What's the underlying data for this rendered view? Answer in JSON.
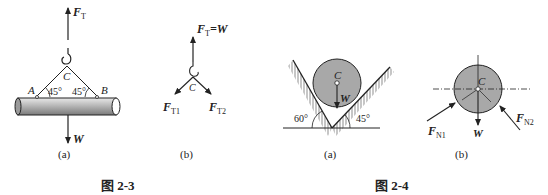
{
  "figure_2_3": {
    "caption": "图 2-3",
    "a": {
      "sublabel": "(a)",
      "force_top": "F",
      "force_top_sub": "T",
      "point_c": "C",
      "point_a": "A",
      "point_b": "B",
      "angle_left": "45°",
      "angle_right": "45°",
      "weight": "W"
    },
    "b": {
      "sublabel": "(b)",
      "force_top": "F",
      "force_top_sub": "T",
      "force_top_eq": "=W",
      "point_c": "C",
      "force_left": "F",
      "force_left_sub": "T1",
      "force_right": "F",
      "force_right_sub": "T2"
    }
  },
  "figure_2_4": {
    "caption": "图 2-4",
    "a": {
      "sublabel": "(a)",
      "point_c": "C",
      "weight": "W",
      "angle_left": "60°",
      "angle_right": "45°"
    },
    "b": {
      "sublabel": "(b)",
      "point_c": "C",
      "weight": "W",
      "force_left": "F",
      "force_left_sub": "N1",
      "force_right": "F",
      "force_right_sub": "N2"
    }
  },
  "colors": {
    "line": "#222222",
    "fill_gray": "#a8a8a8",
    "cylinder_light": "#d8d8d8"
  }
}
